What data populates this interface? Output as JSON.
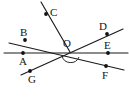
{
  "figure": {
    "kind": "geometry-line-diagram",
    "width": 129,
    "height": 99,
    "background_color": "#ffffff",
    "stroke_color": "#1a1a1a",
    "label_color": "#141414",
    "center_label": "O",
    "center_point": {
      "x": 70,
      "y": 52
    },
    "labels": {
      "A": "A",
      "B": "B",
      "C": "C",
      "D": "D",
      "E": "E",
      "F": "F",
      "G": "G",
      "O": "O"
    },
    "label_positions": {
      "A": {
        "x": 19,
        "y": 56
      },
      "B": {
        "x": 20,
        "y": 27
      },
      "C": {
        "x": 50,
        "y": 7
      },
      "D": {
        "x": 99,
        "y": 21
      },
      "E": {
        "x": 104,
        "y": 40
      },
      "F": {
        "x": 102,
        "y": 70
      },
      "G": {
        "x": 28,
        "y": 74
      },
      "O": {
        "x": 63,
        "y": 38
      }
    },
    "marked_points": [
      {
        "name": "B",
        "x": 25,
        "y": 40
      },
      {
        "name": "A",
        "x": 23,
        "y": 53
      },
      {
        "name": "G",
        "x": 30,
        "y": 71
      },
      {
        "name": "C",
        "x": 46,
        "y": 14
      },
      {
        "name": "D",
        "x": 107,
        "y": 34
      },
      {
        "name": "E",
        "x": 108,
        "y": 53
      },
      {
        "name": "F",
        "x": 106,
        "y": 66
      }
    ],
    "lines": [
      {
        "name": "line-BF",
        "through": "B-O-F",
        "x1": 9,
        "y1": 43,
        "x2": 124,
        "y2": 70
      },
      {
        "name": "line-AE",
        "through": "A-O-E",
        "x1": 4,
        "y1": 53,
        "x2": 128,
        "y2": 53
      },
      {
        "name": "line-GD",
        "through": "G-O-D",
        "x1": 21,
        "y1": 75,
        "x2": 123,
        "y2": 29
      },
      {
        "name": "ray-CO",
        "through": "C-O",
        "x1": 41,
        "y1": 2,
        "x2": 70,
        "y2": 52
      }
    ],
    "angle_arc": {
      "name": "angle-arc-at-O",
      "path": "M 62 56 A 9 9 0 0 0 79 57",
      "description": "arc marking angle below point O"
    }
  }
}
